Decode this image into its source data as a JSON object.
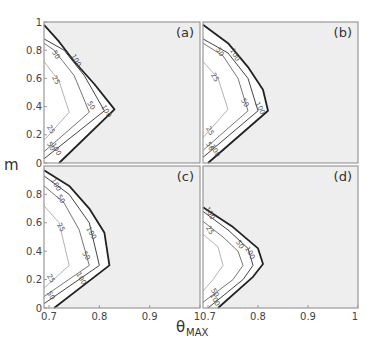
{
  "chart_data": [
    {
      "type": "contour",
      "panel": "(a)",
      "xlabel": "θMAX",
      "ylabel": "m",
      "xlim": [
        0.69,
        1.0
      ],
      "ylim": [
        0,
        1
      ],
      "xticks": [],
      "yticks": [
        "0",
        "0.2",
        "0.4",
        "0.6",
        "0.8",
        "1"
      ],
      "contours": [
        {
          "level": 100,
          "style": "thick",
          "points": [
            [
              0.69,
              0.98
            ],
            [
              0.72,
              0.86
            ],
            [
              0.75,
              0.72
            ],
            [
              0.79,
              0.56
            ],
            [
              0.83,
              0.38
            ],
            [
              0.72,
              0.0
            ]
          ]
        },
        {
          "level": 100,
          "style": "medium",
          "points": [
            [
              0.69,
              0.88
            ],
            [
              0.73,
              0.8
            ],
            [
              0.77,
              0.62
            ],
            [
              0.81,
              0.37
            ],
            [
              0.69,
              0.03
            ]
          ]
        },
        {
          "level": 50,
          "style": "thin",
          "points": [
            [
              0.69,
              0.85
            ],
            [
              0.71,
              0.8
            ],
            [
              0.75,
              0.62
            ],
            [
              0.78,
              0.36
            ],
            [
              0.69,
              0.08
            ]
          ]
        },
        {
          "level": 25,
          "style": "light",
          "points": [
            [
              0.69,
              0.72
            ],
            [
              0.72,
              0.58
            ],
            [
              0.74,
              0.36
            ],
            [
              0.69,
              0.16
            ]
          ]
        }
      ],
      "contour_labels": [
        {
          "text": "50",
          "at": [
            0.71,
            0.76
          ]
        },
        {
          "text": "100",
          "at": [
            0.75,
            0.72
          ]
        },
        {
          "text": "25",
          "at": [
            0.71,
            0.58
          ]
        },
        {
          "text": "50",
          "at": [
            0.78,
            0.4
          ]
        },
        {
          "text": "100",
          "at": [
            0.81,
            0.36
          ]
        },
        {
          "text": "25",
          "at": [
            0.7,
            0.23
          ]
        },
        {
          "text": "50",
          "at": [
            0.7,
            0.11
          ]
        },
        {
          "text": "100",
          "at": [
            0.71,
            0.09
          ]
        }
      ]
    },
    {
      "type": "contour",
      "panel": "(b)",
      "xlim": [
        0.69,
        1.0
      ],
      "ylim": [
        0,
        1
      ],
      "contours": [
        {
          "level": 100,
          "style": "thick",
          "points": [
            [
              0.69,
              0.98
            ],
            [
              0.74,
              0.85
            ],
            [
              0.78,
              0.68
            ],
            [
              0.81,
              0.52
            ],
            [
              0.82,
              0.37
            ],
            [
              0.7,
              0.0
            ]
          ]
        },
        {
          "level": 100,
          "style": "medium",
          "points": [
            [
              0.69,
              0.88
            ],
            [
              0.74,
              0.78
            ],
            [
              0.78,
              0.6
            ],
            [
              0.8,
              0.37
            ],
            [
              0.69,
              0.04
            ]
          ]
        },
        {
          "level": 50,
          "style": "thin",
          "points": [
            [
              0.69,
              0.85
            ],
            [
              0.73,
              0.76
            ],
            [
              0.76,
              0.6
            ],
            [
              0.78,
              0.37
            ],
            [
              0.69,
              0.09
            ]
          ]
        },
        {
          "level": 25,
          "style": "light",
          "points": [
            [
              0.69,
              0.72
            ],
            [
              0.72,
              0.6
            ],
            [
              0.74,
              0.38
            ],
            [
              0.69,
              0.18
            ]
          ]
        }
      ],
      "contour_labels": [
        {
          "text": "50",
          "at": [
            0.72,
            0.78
          ]
        },
        {
          "text": "100",
          "at": [
            0.75,
            0.76
          ]
        },
        {
          "text": "25",
          "at": [
            0.71,
            0.6
          ]
        },
        {
          "text": "50",
          "at": [
            0.77,
            0.42
          ]
        },
        {
          "text": "100",
          "at": [
            0.8,
            0.38
          ]
        },
        {
          "text": "25",
          "at": [
            0.7,
            0.22
          ]
        },
        {
          "text": "50",
          "at": [
            0.7,
            0.11
          ]
        },
        {
          "text": "100",
          "at": [
            0.71,
            0.08
          ]
        }
      ]
    },
    {
      "type": "contour",
      "panel": "(c)",
      "xlim": [
        0.69,
        1.0
      ],
      "ylim": [
        0,
        1
      ],
      "xticks": [
        "0.7",
        "0.8",
        "0.9",
        "1"
      ],
      "yticks": [
        "0",
        "0.2",
        "0.4",
        "0.6",
        "0.8"
      ],
      "contours": [
        {
          "level": 100,
          "style": "thick",
          "points": [
            [
              0.69,
              0.97
            ],
            [
              0.74,
              0.86
            ],
            [
              0.78,
              0.7
            ],
            [
              0.81,
              0.53
            ],
            [
              0.82,
              0.3
            ],
            [
              0.71,
              0.0
            ]
          ]
        },
        {
          "level": 100,
          "style": "medium",
          "points": [
            [
              0.69,
              0.93
            ],
            [
              0.74,
              0.8
            ],
            [
              0.78,
              0.6
            ],
            [
              0.8,
              0.3
            ],
            [
              0.69,
              0.03
            ]
          ]
        },
        {
          "level": 50,
          "style": "thin",
          "points": [
            [
              0.69,
              0.86
            ],
            [
              0.73,
              0.74
            ],
            [
              0.76,
              0.55
            ],
            [
              0.78,
              0.3
            ],
            [
              0.69,
              0.08
            ]
          ]
        },
        {
          "level": 25,
          "style": "light",
          "points": [
            [
              0.69,
              0.72
            ],
            [
              0.72,
              0.6
            ],
            [
              0.74,
              0.3
            ],
            [
              0.69,
              0.14
            ]
          ]
        }
      ],
      "contour_labels": [
        {
          "text": "100",
          "at": [
            0.71,
            0.86
          ]
        },
        {
          "text": "50",
          "at": [
            0.72,
            0.76
          ]
        },
        {
          "text": "25",
          "at": [
            0.72,
            0.56
          ]
        },
        {
          "text": "100",
          "at": [
            0.78,
            0.52
          ]
        },
        {
          "text": "50",
          "at": [
            0.77,
            0.36
          ]
        },
        {
          "text": "25",
          "at": [
            0.7,
            0.2
          ]
        },
        {
          "text": "100",
          "at": [
            0.76,
            0.2
          ]
        },
        {
          "text": "50",
          "at": [
            0.7,
            0.08
          ]
        }
      ]
    },
    {
      "type": "contour",
      "panel": "(d)",
      "xlim": [
        0.69,
        1.0
      ],
      "ylim": [
        0,
        1
      ],
      "xticks": [
        "0.7",
        "0.8",
        "0.9",
        "1"
      ],
      "contours": [
        {
          "level": 100,
          "style": "thick",
          "points": [
            [
              0.69,
              0.71
            ],
            [
              0.75,
              0.57
            ],
            [
              0.8,
              0.42
            ],
            [
              0.81,
              0.31
            ],
            [
              0.79,
              0.22
            ],
            [
              0.72,
              0.0
            ]
          ]
        },
        {
          "level": 100,
          "style": "medium",
          "points": [
            [
              0.69,
              0.68
            ],
            [
              0.74,
              0.55
            ],
            [
              0.78,
              0.42
            ],
            [
              0.79,
              0.3
            ],
            [
              0.77,
              0.2
            ],
            [
              0.7,
              0.0
            ]
          ]
        },
        {
          "level": 50,
          "style": "thin",
          "points": [
            [
              0.69,
              0.61
            ],
            [
              0.73,
              0.5
            ],
            [
              0.76,
              0.4
            ],
            [
              0.77,
              0.3
            ],
            [
              0.75,
              0.2
            ],
            [
              0.69,
              0.04
            ]
          ]
        },
        {
          "level": 25,
          "style": "light",
          "points": [
            [
              0.69,
              0.52
            ],
            [
              0.72,
              0.43
            ],
            [
              0.73,
              0.3
            ],
            [
              0.71,
              0.2
            ],
            [
              0.69,
              0.12
            ]
          ]
        }
      ],
      "contour_labels": [
        {
          "text": "100",
          "at": [
            0.7,
            0.66
          ]
        },
        {
          "text": "25",
          "at": [
            0.7,
            0.54
          ]
        },
        {
          "text": "50",
          "at": [
            0.76,
            0.44
          ]
        },
        {
          "text": "100",
          "at": [
            0.78,
            0.38
          ]
        },
        {
          "text": "50",
          "at": [
            0.71,
            0.1
          ]
        },
        {
          "text": "100",
          "at": [
            0.71,
            0.05
          ]
        }
      ]
    }
  ],
  "figure": {
    "ylabel": "m",
    "xlabel_main": "θ",
    "xlabel_sub": "MAX",
    "panel_labels": [
      "(a)",
      "(b)",
      "(c)",
      "(d)"
    ],
    "xticks": [
      "0.7",
      "0.8",
      "0.9",
      "1"
    ],
    "yticks_top": [
      "0",
      "0.2",
      "0.4",
      "0.6",
      "0.8",
      "1"
    ],
    "yticks_bottom": [
      "0",
      "0.2",
      "0.4",
      "0.6",
      "0.8"
    ],
    "colors": {
      "shaded_region": "#eeeeee",
      "frame": "#999999",
      "thick_contour": "#222222",
      "medium_contour": "#444444",
      "thin_contour": "#666666",
      "light_contour": "#aaaaaa"
    }
  }
}
